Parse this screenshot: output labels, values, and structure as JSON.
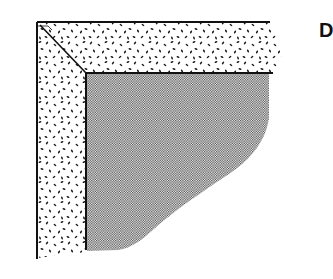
{
  "figure": {
    "panel_label": "D",
    "colors": {
      "line": "#111111",
      "speckle": "#1a1a1a",
      "shade": "#555555",
      "background": "#ffffff"
    }
  }
}
